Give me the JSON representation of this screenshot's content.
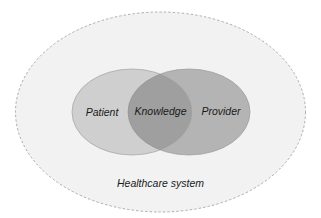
{
  "diagram": {
    "outer": {
      "label": "Healthcare system",
      "fill": "#f2f2f2",
      "stroke": "#9a9a9a"
    },
    "sets": [
      {
        "label": "Patient",
        "fill": "#cfcfcf",
        "stroke": "#a8a8a8"
      },
      {
        "label": "Provider",
        "fill": "#b4b4b4",
        "stroke": "#a0a0a0"
      }
    ],
    "intersection": {
      "label": "Knowledge",
      "fill": "#9f9f9f"
    }
  }
}
